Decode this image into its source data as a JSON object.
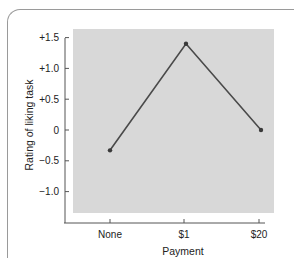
{
  "chart_data": {
    "type": "line",
    "title": "",
    "xlabel": "Payment",
    "ylabel": "Rating of liking task",
    "categories": [
      "None",
      "$1",
      "$20"
    ],
    "series": [
      {
        "name": "Rating of liking task",
        "values": [
          -0.33,
          1.4,
          0.0
        ]
      }
    ],
    "yticks": [
      "+1.5",
      "+1.0",
      "+0.5",
      "0",
      "−0.5",
      "−1.0"
    ],
    "ytick_values": [
      1.5,
      1.0,
      0.5,
      0,
      -0.5,
      -1.0
    ],
    "ylim": [
      -1.35,
      1.65
    ],
    "grid": false,
    "legend": null,
    "colors": {
      "line": "#4a4a4a",
      "plot_bg": "#d8d8d8",
      "axis": "#555555"
    }
  }
}
